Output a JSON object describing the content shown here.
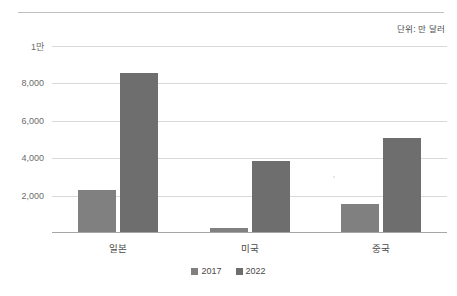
{
  "unit_note": "단위: 만 달러",
  "legend": {
    "items": [
      {
        "label": "2017",
        "color": "#808080"
      },
      {
        "label": "2022",
        "color": "#6e6e6e"
      }
    ]
  },
  "chart_data": {
    "type": "bar",
    "title": "",
    "subtitle": "",
    "xlabel": "",
    "ylabel": "",
    "annotations": [
      "단위: 만 달러"
    ],
    "categories": [
      "일본",
      "미국",
      "중국"
    ],
    "series": [
      {
        "name": "2017",
        "color": "#808080",
        "values": [
          2250,
          200,
          1500
        ]
      },
      {
        "name": "2022",
        "color": "#6e6e6e",
        "values": [
          8500,
          3800,
          5050
        ]
      }
    ],
    "ylim": [
      0,
      10000
    ],
    "yticks": [
      2000,
      4000,
      6000,
      8000,
      10000
    ],
    "ytick_labels": [
      "2,000",
      "4,000",
      "6,000",
      "8,000",
      "1만"
    ],
    "grid": true,
    "legend_position": "bottom"
  }
}
